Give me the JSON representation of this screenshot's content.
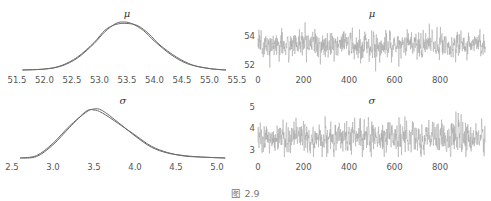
{
  "caption": "图 2.9",
  "chart_data": [
    {
      "type": "line",
      "title": "μ",
      "panel": "kde",
      "xlabel": "",
      "ylabel": "",
      "xlim": [
        51.5,
        55.5
      ],
      "xticks": [
        "51.5",
        "52.0",
        "52.5",
        "53.0",
        "53.5",
        "54.0",
        "54.5",
        "55.0",
        "55.5"
      ],
      "grid": false,
      "series": [
        {
          "name": "chain 1",
          "x": [
            51.6,
            52.0,
            52.3,
            52.6,
            52.9,
            53.1,
            53.3,
            53.45,
            53.6,
            53.8,
            54.0,
            54.3,
            54.6,
            55.0,
            55.3
          ],
          "y": [
            0.0,
            0.02,
            0.08,
            0.25,
            0.55,
            0.8,
            0.97,
            1.0,
            0.96,
            0.82,
            0.6,
            0.32,
            0.13,
            0.03,
            0.0
          ]
        },
        {
          "name": "chain 2",
          "x": [
            51.6,
            52.0,
            52.3,
            52.6,
            52.9,
            53.1,
            53.3,
            53.5,
            53.7,
            53.9,
            54.1,
            54.4,
            54.7,
            55.0,
            55.3
          ],
          "y": [
            0.0,
            0.02,
            0.09,
            0.27,
            0.57,
            0.83,
            0.95,
            0.97,
            0.92,
            0.75,
            0.52,
            0.27,
            0.1,
            0.03,
            0.0
          ]
        }
      ]
    },
    {
      "type": "line",
      "title": "μ",
      "panel": "trace",
      "xlabel": "",
      "ylabel": "",
      "xlim": [
        0,
        1000
      ],
      "ylim": [
        51.5,
        55
      ],
      "xticks": [
        "0",
        "200",
        "400",
        "600",
        "800"
      ],
      "yticks": [
        "52",
        "54"
      ],
      "grid": false,
      "series": [
        {
          "name": "trace",
          "mean": 53.4,
          "sd": 0.45,
          "n": 1000
        }
      ]
    },
    {
      "type": "line",
      "title": "σ",
      "panel": "kde",
      "xlabel": "",
      "ylabel": "",
      "xlim": [
        2.5,
        5.0
      ],
      "xticks": [
        "2.5",
        "3.0",
        "3.5",
        "4.0",
        "4.5",
        "5.0"
      ],
      "grid": false,
      "series": [
        {
          "name": "chain 1",
          "x": [
            2.6,
            2.8,
            3.0,
            3.2,
            3.4,
            3.5,
            3.6,
            3.8,
            4.0,
            4.2,
            4.4,
            4.6,
            4.8,
            5.1
          ],
          "y": [
            0.0,
            0.05,
            0.3,
            0.65,
            0.93,
            1.0,
            0.97,
            0.72,
            0.45,
            0.22,
            0.1,
            0.05,
            0.02,
            0.0
          ]
        },
        {
          "name": "chain 2",
          "x": [
            2.6,
            2.8,
            3.0,
            3.2,
            3.4,
            3.5,
            3.6,
            3.8,
            4.0,
            4.2,
            4.4,
            4.6,
            4.8,
            5.1
          ],
          "y": [
            0.0,
            0.03,
            0.27,
            0.62,
            0.95,
            0.98,
            0.92,
            0.7,
            0.47,
            0.24,
            0.11,
            0.04,
            0.02,
            0.0
          ]
        }
      ]
    },
    {
      "type": "line",
      "title": "σ",
      "panel": "trace",
      "xlabel": "",
      "ylabel": "",
      "xlim": [
        0,
        1000
      ],
      "ylim": [
        2.6,
        5.1
      ],
      "xticks": [
        "0",
        "200",
        "400",
        "600",
        "800"
      ],
      "yticks": [
        "3",
        "4",
        "5"
      ],
      "grid": false,
      "series": [
        {
          "name": "trace",
          "mean": 3.55,
          "sd": 0.35,
          "n": 1000
        }
      ]
    }
  ],
  "colors": {
    "line": "#6b6b6b",
    "trace": "#a8a8a8",
    "tick_text": "#555555"
  }
}
